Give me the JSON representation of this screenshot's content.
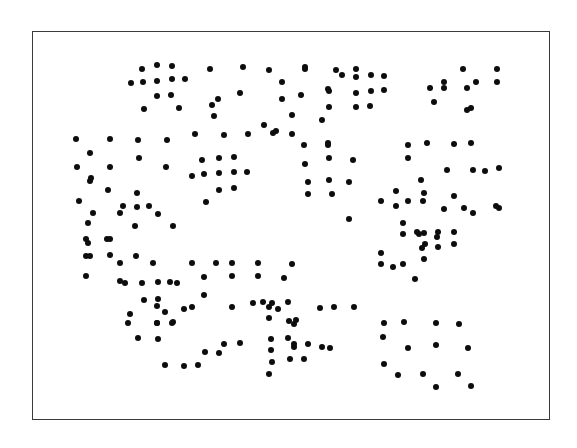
{
  "figure": {
    "background_color": "#ffffff",
    "frame": {
      "stroke_color": "#3a3a3a",
      "stroke_width": 1.5,
      "fill_color": "#ffffff",
      "left": 32,
      "top": 31,
      "width": 518,
      "height": 389
    }
  },
  "chart_data": {
    "type": "scatter",
    "title": "",
    "subtitle": "",
    "xlabel": "",
    "ylabel": "",
    "grid": false,
    "legend": null,
    "annotations": [],
    "xtick_labels": [],
    "ytick_labels": [],
    "xlim": [
      0,
      518
    ],
    "ylim": [
      0,
      389
    ],
    "marker": {
      "shape": "circle",
      "color": "#0d0d0d",
      "size_px": 6.6
    },
    "n_points": 214,
    "points": [
      [
        109,
        37
      ],
      [
        124,
        33
      ],
      [
        139,
        34
      ],
      [
        177,
        37
      ],
      [
        210,
        35
      ],
      [
        236,
        38
      ],
      [
        272,
        37
      ],
      [
        430,
        37
      ],
      [
        464,
        37
      ],
      [
        98,
        51
      ],
      [
        110,
        50
      ],
      [
        124,
        49
      ],
      [
        139,
        47
      ],
      [
        152,
        47
      ],
      [
        249,
        50
      ],
      [
        272,
        35
      ],
      [
        303,
        38
      ],
      [
        323,
        37
      ],
      [
        309,
        43
      ],
      [
        323,
        45
      ],
      [
        338,
        43
      ],
      [
        351,
        44
      ],
      [
        443,
        50
      ],
      [
        464,
        50
      ],
      [
        124,
        64
      ],
      [
        138,
        63
      ],
      [
        295,
        57
      ],
      [
        296,
        59
      ],
      [
        323,
        61
      ],
      [
        338,
        59
      ],
      [
        351,
        58
      ],
      [
        411,
        50
      ],
      [
        397,
        56
      ],
      [
        111,
        77
      ],
      [
        146,
        76
      ],
      [
        179,
        73
      ],
      [
        185,
        67
      ],
      [
        207,
        61
      ],
      [
        249,
        67
      ],
      [
        296,
        75
      ],
      [
        323,
        75
      ],
      [
        337,
        74
      ],
      [
        401,
        70
      ],
      [
        411,
        56
      ],
      [
        434,
        56
      ],
      [
        438,
        76
      ],
      [
        181,
        84
      ],
      [
        259,
        83
      ],
      [
        231,
        93
      ],
      [
        268,
        63
      ],
      [
        289,
        88
      ],
      [
        243,
        99
      ],
      [
        295,
        111
      ],
      [
        434,
        78
      ],
      [
        43,
        107
      ],
      [
        77,
        107
      ],
      [
        105,
        108
      ],
      [
        134,
        108
      ],
      [
        162,
        102
      ],
      [
        191,
        103
      ],
      [
        215,
        102
      ],
      [
        240,
        101
      ],
      [
        259,
        102
      ],
      [
        271,
        113
      ],
      [
        295,
        113
      ],
      [
        375,
        113
      ],
      [
        394,
        111
      ],
      [
        421,
        112
      ],
      [
        438,
        111
      ],
      [
        57,
        121
      ],
      [
        106,
        126
      ],
      [
        169,
        128
      ],
      [
        186,
        126
      ],
      [
        201,
        125
      ],
      [
        296,
        126
      ],
      [
        320,
        128
      ],
      [
        375,
        126
      ],
      [
        440,
        138
      ],
      [
        466,
        136
      ],
      [
        44,
        135
      ],
      [
        77,
        135
      ],
      [
        133,
        135
      ],
      [
        159,
        144
      ],
      [
        171,
        142
      ],
      [
        186,
        141
      ],
      [
        201,
        140
      ],
      [
        214,
        140
      ],
      [
        272,
        132
      ],
      [
        296,
        148
      ],
      [
        388,
        148
      ],
      [
        414,
        138
      ],
      [
        452,
        139
      ],
      [
        58,
        146
      ],
      [
        186,
        158
      ],
      [
        201,
        156
      ],
      [
        275,
        150
      ],
      [
        299,
        162
      ],
      [
        363,
        159
      ],
      [
        390,
        169
      ],
      [
        421,
        164
      ],
      [
        75,
        158
      ],
      [
        104,
        161
      ],
      [
        173,
        170
      ],
      [
        275,
        162
      ],
      [
        46,
        169
      ],
      [
        60,
        181
      ],
      [
        90,
        174
      ],
      [
        116,
        174
      ],
      [
        363,
        174
      ],
      [
        391,
        161
      ],
      [
        431,
        176
      ],
      [
        53,
        207
      ],
      [
        74,
        207
      ],
      [
        53,
        224
      ],
      [
        77,
        223
      ],
      [
        53,
        244
      ],
      [
        87,
        231
      ],
      [
        55,
        191
      ],
      [
        77,
        207
      ],
      [
        104,
        175
      ],
      [
        316,
        187
      ],
      [
        348,
        169
      ],
      [
        316,
        150
      ],
      [
        391,
        201
      ],
      [
        405,
        200
      ],
      [
        411,
        177
      ],
      [
        55,
        211
      ],
      [
        102,
        194
      ],
      [
        125,
        182
      ],
      [
        140,
        194
      ],
      [
        92,
        251
      ],
      [
        109,
        251
      ],
      [
        125,
        250
      ],
      [
        137,
        250
      ],
      [
        111,
        268
      ],
      [
        125,
        267
      ],
      [
        97,
        282
      ],
      [
        132,
        280
      ],
      [
        386,
        202
      ],
      [
        421,
        200
      ],
      [
        405,
        215
      ],
      [
        463,
        174
      ],
      [
        392,
        212
      ],
      [
        421,
        212
      ],
      [
        440,
        181
      ],
      [
        466,
        176
      ],
      [
        124,
        291
      ],
      [
        140,
        290
      ],
      [
        159,
        231
      ],
      [
        183,
        231
      ],
      [
        199,
        231
      ],
      [
        225,
        231
      ],
      [
        259,
        232
      ],
      [
        171,
        245
      ],
      [
        199,
        244
      ],
      [
        225,
        244
      ],
      [
        251,
        246
      ],
      [
        139,
        291
      ],
      [
        95,
        291
      ],
      [
        105,
        306
      ],
      [
        125,
        307
      ],
      [
        132,
        333
      ],
      [
        159,
        275
      ],
      [
        199,
        275
      ],
      [
        236,
        275
      ],
      [
        236,
        286
      ],
      [
        256,
        289
      ],
      [
        261,
        292
      ],
      [
        144,
        251
      ],
      [
        171,
        263
      ],
      [
        124,
        274
      ],
      [
        261,
        315
      ],
      [
        297,
        316
      ],
      [
        384,
        200
      ],
      [
        389,
        216
      ],
      [
        391,
        227
      ],
      [
        404,
        205
      ],
      [
        239,
        271
      ],
      [
        255,
        270
      ],
      [
        287,
        276
      ],
      [
        301,
        275
      ],
      [
        321,
        275
      ],
      [
        348,
        221
      ],
      [
        370,
        202
      ],
      [
        370,
        191
      ],
      [
        375,
        169
      ],
      [
        151,
        277
      ],
      [
        238,
        307
      ],
      [
        255,
        306
      ],
      [
        263,
        288
      ],
      [
        124,
        291
      ],
      [
        191,
        312
      ],
      [
        207,
        311
      ],
      [
        238,
        318
      ],
      [
        261,
        312
      ],
      [
        348,
        232
      ],
      [
        360,
        235
      ],
      [
        370,
        232
      ],
      [
        382,
        247
      ],
      [
        351,
        291
      ],
      [
        371,
        290
      ],
      [
        403,
        291
      ],
      [
        426,
        292
      ],
      [
        350,
        305
      ],
      [
        375,
        316
      ],
      [
        403,
        313
      ],
      [
        435,
        316
      ],
      [
        351,
        332
      ],
      [
        365,
        343
      ],
      [
        390,
        342
      ],
      [
        425,
        342
      ],
      [
        403,
        355
      ],
      [
        438,
        354
      ],
      [
        239,
        330
      ],
      [
        257,
        327
      ],
      [
        275,
        312
      ],
      [
        289,
        315
      ],
      [
        236,
        342
      ],
      [
        271,
        327
      ],
      [
        151,
        334
      ],
      [
        165,
        333
      ],
      [
        172,
        320
      ],
      [
        186,
        321
      ],
      [
        220,
        271
      ],
      [
        230,
        270
      ],
      [
        245,
        277
      ],
      [
        103,
        224
      ],
      [
        120,
        231
      ],
      [
        57,
        149
      ],
      [
        87,
        181
      ],
      [
        57,
        224
      ],
      [
        87,
        249
      ]
    ]
  }
}
